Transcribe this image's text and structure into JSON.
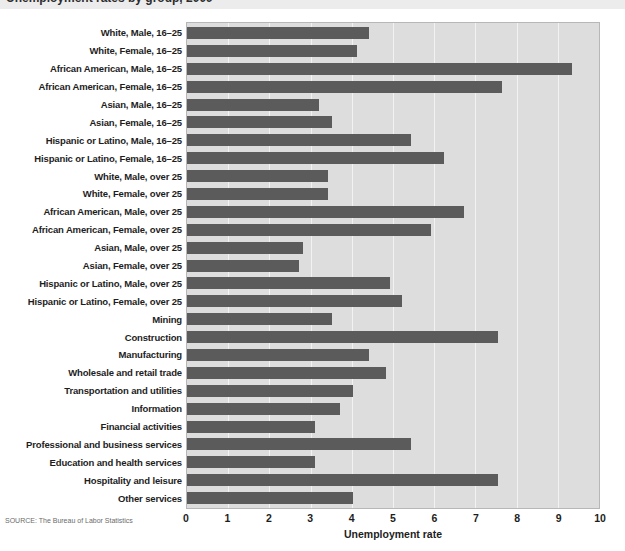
{
  "title": "Unemployment rates by group, 2009",
  "source": "SOURCE: The Bureau of Labor Statistics",
  "colors": {
    "bar": "#5b5b5b",
    "plot_background": "#dddddd",
    "gridline": "#f2f2f2",
    "page_background": "#ffffff",
    "text": "#1d1d1d"
  },
  "axis": {
    "x_label": "Unemployment rate",
    "x_ticks": [
      "0",
      "1",
      "2",
      "3",
      "4",
      "5",
      "6",
      "7",
      "8",
      "9",
      "10"
    ]
  },
  "chart_data": {
    "type": "bar",
    "orientation": "horizontal",
    "title": "Unemployment rates by group, 2009",
    "xlabel": "Unemployment rate",
    "ylabel": "",
    "xlim": [
      0,
      10
    ],
    "grid": true,
    "legend": "none",
    "source": "SOURCE: The Bureau of Labor Statistics",
    "categories": [
      "White, Male, 16–25",
      "White, Female, 16–25",
      "African American, Male, 16–25",
      "African American, Female, 16–25",
      "Asian, Male, 16–25",
      "Asian, Female, 16–25",
      "Hispanic or Latino, Male, 16–25",
      "Hispanic or Latino, Female, 16–25",
      "White, Male, over 25",
      "White, Female, over 25",
      "African American, Male, over 25",
      "African American, Female, over 25",
      "Asian, Male, over 25",
      "Asian, Female, over 25",
      "Hispanic or Latino, Male, over 25",
      "Hispanic or Latino, Female, over 25",
      "Mining",
      "Construction",
      "Manufacturing",
      "Wholesale and retail trade",
      "Transportation and utilities",
      "Information",
      "Financial activities",
      "Professional and business services",
      "Education and health services",
      "Hospitality and leisure",
      "Other services"
    ],
    "values": [
      4.4,
      4.1,
      9.3,
      7.6,
      3.2,
      3.5,
      5.4,
      6.2,
      3.4,
      3.4,
      6.7,
      5.9,
      2.8,
      2.7,
      4.9,
      5.2,
      3.5,
      7.5,
      4.4,
      4.8,
      4.0,
      3.7,
      3.1,
      5.4,
      3.1,
      7.5,
      4.0
    ]
  }
}
